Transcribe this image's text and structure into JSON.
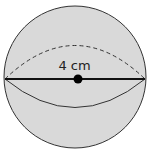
{
  "diagram": {
    "shape": "sphere",
    "fill_color": "#d9d9d9",
    "stroke_color": "#222222",
    "diameter_label": "4 cm",
    "elements": [
      "outline-circle",
      "equator-front-solid",
      "equator-back-dashed",
      "diameter-line",
      "center-point"
    ]
  }
}
